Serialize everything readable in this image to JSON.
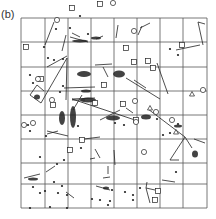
{
  "figure": {
    "panel_label": "(b)",
    "grid": {
      "cols": 8,
      "rows": 8,
      "x_lines": [
        21,
        45,
        68,
        91,
        114,
        137,
        160,
        183,
        207
      ],
      "y_lines": [
        18,
        42,
        67,
        91,
        115,
        139,
        163,
        184,
        208
      ],
      "color": "#555555"
    },
    "ink_color": "#222222",
    "squares": [
      [
        26,
        47
      ],
      [
        41,
        79
      ],
      [
        126,
        48
      ],
      [
        134,
        62
      ],
      [
        153,
        68
      ],
      [
        104,
        85
      ],
      [
        182,
        45
      ],
      [
        53,
        105
      ],
      [
        95,
        103
      ],
      [
        100,
        4
      ],
      [
        72,
        8
      ],
      [
        148,
        61
      ],
      [
        155,
        200
      ],
      [
        158,
        191
      ],
      [
        70,
        150
      ],
      [
        82,
        140
      ],
      [
        136,
        120
      ],
      [
        123,
        104
      ]
    ],
    "circles": [
      [
        38,
        79
      ],
      [
        57,
        20
      ],
      [
        52,
        100
      ],
      [
        135,
        101
      ],
      [
        136,
        122
      ],
      [
        156,
        112
      ],
      [
        172,
        120
      ],
      [
        24,
        125
      ],
      [
        33,
        123
      ],
      [
        113,
        3
      ],
      [
        203,
        90
      ],
      [
        144,
        152
      ],
      [
        134,
        31
      ]
    ],
    "triangles": [
      [
        150,
        108
      ],
      [
        176,
        132
      ],
      [
        192,
        94
      ]
    ],
    "dots": [
      [
        30,
        75
      ],
      [
        33,
        83
      ],
      [
        63,
        59
      ],
      [
        56,
        29
      ],
      [
        70,
        28
      ],
      [
        88,
        34
      ],
      [
        80,
        16
      ],
      [
        170,
        49
      ],
      [
        178,
        55
      ],
      [
        115,
        123
      ],
      [
        124,
        125
      ],
      [
        44,
        47
      ],
      [
        54,
        60
      ],
      [
        48,
        58
      ],
      [
        63,
        86
      ],
      [
        60,
        92
      ],
      [
        28,
        125
      ],
      [
        30,
        131
      ],
      [
        40,
        157
      ],
      [
        46,
        136
      ],
      [
        57,
        164
      ],
      [
        64,
        160
      ],
      [
        78,
        126
      ],
      [
        81,
        148
      ],
      [
        54,
        182
      ],
      [
        62,
        186
      ],
      [
        58,
        193
      ],
      [
        45,
        191
      ],
      [
        67,
        195
      ],
      [
        67,
        208
      ],
      [
        50,
        207
      ],
      [
        30,
        208
      ],
      [
        100,
        200
      ],
      [
        92,
        199
      ],
      [
        110,
        201
      ],
      [
        112,
        190
      ],
      [
        133,
        195
      ],
      [
        140,
        188
      ],
      [
        170,
        133
      ],
      [
        178,
        124
      ],
      [
        157,
        119
      ],
      [
        108,
        205
      ],
      [
        163,
        135
      ],
      [
        176,
        172
      ],
      [
        125,
        192
      ],
      [
        133,
        200
      ],
      [
        40,
        193
      ],
      [
        33,
        187
      ]
    ],
    "segments": [
      [
        [
          45,
          45
        ],
        [
          54,
          22
        ]
      ],
      [
        [
          62,
          51
        ],
        [
          66,
          35
        ]
      ],
      [
        [
          70,
          37
        ],
        [
          88,
          42
        ]
      ],
      [
        [
          80,
          37
        ],
        [
          72,
          33
        ]
      ],
      [
        [
          96,
          39
        ],
        [
          103,
          36
        ]
      ],
      [
        [
          116,
          38
        ],
        [
          118,
          25
        ]
      ],
      [
        [
          138,
          35
        ],
        [
          142,
          26
        ]
      ],
      [
        [
          140,
          28
        ],
        [
          150,
          23
        ]
      ],
      [
        [
          198,
          22
        ],
        [
          205,
          24
        ]
      ],
      [
        [
          198,
          22
        ],
        [
          203,
          45
        ]
      ],
      [
        [
          176,
          50
        ],
        [
          200,
          45
        ]
      ],
      [
        [
          47,
          67
        ],
        [
          67,
          56
        ]
      ],
      [
        [
          37,
          85
        ],
        [
          44,
          91
        ]
      ],
      [
        [
          37,
          85
        ],
        [
          30,
          95
        ]
      ],
      [
        [
          30,
          95
        ],
        [
          41,
          103
        ]
      ],
      [
        [
          41,
          103
        ],
        [
          67,
          58
        ]
      ],
      [
        [
          67,
          58
        ],
        [
          66,
          100
        ]
      ],
      [
        [
          64,
          88
        ],
        [
          95,
          87
        ]
      ],
      [
        [
          95,
          65
        ],
        [
          112,
          64
        ]
      ],
      [
        [
          103,
          67
        ],
        [
          108,
          77
        ]
      ],
      [
        [
          134,
          80
        ],
        [
          146,
          88
        ]
      ],
      [
        [
          126,
          78
        ],
        [
          160,
          99
        ]
      ],
      [
        [
          157,
          63
        ],
        [
          168,
          94
        ]
      ],
      [
        [
          72,
          99
        ],
        [
          95,
          98
        ]
      ],
      [
        [
          72,
          99
        ],
        [
          135,
          120
        ]
      ],
      [
        [
          82,
          95
        ],
        [
          73,
          110
        ]
      ],
      [
        [
          72,
          100
        ],
        [
          85,
          100
        ]
      ],
      [
        [
          100,
          120
        ],
        [
          120,
          110
        ]
      ],
      [
        [
          148,
          109
        ],
        [
          185,
          137
        ]
      ],
      [
        [
          185,
          137
        ],
        [
          192,
          148
        ]
      ],
      [
        [
          185,
          137
        ],
        [
          170,
          160
        ]
      ],
      [
        [
          170,
          160
        ],
        [
          179,
          160
        ]
      ],
      [
        [
          133,
          113
        ],
        [
          126,
          108
        ]
      ],
      [
        [
          47,
          134
        ],
        [
          58,
          131
        ]
      ],
      [
        [
          47,
          131
        ],
        [
          68,
          136
        ]
      ],
      [
        [
          84,
          139
        ],
        [
          100,
          137
        ]
      ],
      [
        [
          90,
          159
        ],
        [
          95,
          158
        ]
      ],
      [
        [
          95,
          149
        ],
        [
          100,
          158
        ]
      ],
      [
        [
          103,
          178
        ],
        [
          110,
          177
        ]
      ],
      [
        [
          108,
          174
        ],
        [
          108,
          166
        ]
      ],
      [
        [
          115,
          165
        ],
        [
          114,
          150
        ]
      ],
      [
        [
          146,
          188
        ],
        [
          147,
          182
        ]
      ],
      [
        [
          146,
          188
        ],
        [
          155,
          190
        ]
      ],
      [
        [
          146,
          188
        ],
        [
          150,
          203
        ]
      ],
      [
        [
          194,
          139
        ],
        [
          205,
          143
        ]
      ],
      [
        [
          162,
          180
        ],
        [
          175,
          182
        ]
      ],
      [
        [
          46,
          172
        ],
        [
          55,
          166
        ]
      ],
      [
        [
          24,
          178
        ],
        [
          40,
          174
        ]
      ],
      [
        [
          66,
          192
        ],
        [
          74,
          198
        ]
      ],
      [
        [
          96,
          186
        ],
        [
          110,
          190
        ]
      ]
    ],
    "clusters": [
      {
        "cx": 80,
        "cy": 41,
        "w": 16,
        "h": 3
      },
      {
        "cx": 96,
        "cy": 38,
        "w": 10,
        "h": 3
      },
      {
        "cx": 119,
        "cy": 74,
        "w": 12,
        "h": 7
      },
      {
        "cx": 37,
        "cy": 97,
        "w": 6,
        "h": 5
      },
      {
        "cx": 84,
        "cy": 74,
        "w": 14,
        "h": 6
      },
      {
        "cx": 86,
        "cy": 91,
        "w": 10,
        "h": 3
      },
      {
        "cx": 73,
        "cy": 117,
        "w": 6,
        "h": 22
      },
      {
        "cx": 62,
        "cy": 118,
        "w": 6,
        "h": 14
      },
      {
        "cx": 146,
        "cy": 117,
        "w": 10,
        "h": 5
      },
      {
        "cx": 113,
        "cy": 118,
        "w": 14,
        "h": 5
      },
      {
        "cx": 195,
        "cy": 154,
        "w": 6,
        "h": 7
      },
      {
        "cx": 88,
        "cy": 100,
        "w": 16,
        "h": 5
      },
      {
        "cx": 33,
        "cy": 179,
        "w": 10,
        "h": 3
      },
      {
        "cx": 106,
        "cy": 188,
        "w": 6,
        "h": 3
      },
      {
        "cx": 178,
        "cy": 126,
        "w": 8,
        "h": 3
      }
    ]
  }
}
